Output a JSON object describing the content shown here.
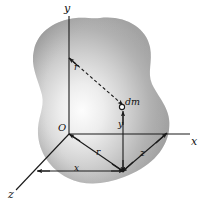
{
  "figure": {
    "kind": "3d-coordinate-diagram",
    "background_color": "#ffffff",
    "body_fill_light": "#f4f4f4",
    "body_fill_mid": "#bdbdbd",
    "body_fill_dark": "#9a9a9a",
    "line_color": "#1a1a1a"
  },
  "axes": {
    "y_axis_label": "y",
    "x_axis_label": "x",
    "z_axis_label": "z",
    "origin_label": "O"
  },
  "labels": {
    "mass_element": "dm",
    "radial_distance": "r",
    "coord_x": "x",
    "coord_y": "y",
    "coord_z": "z",
    "upper_segment": "r"
  }
}
